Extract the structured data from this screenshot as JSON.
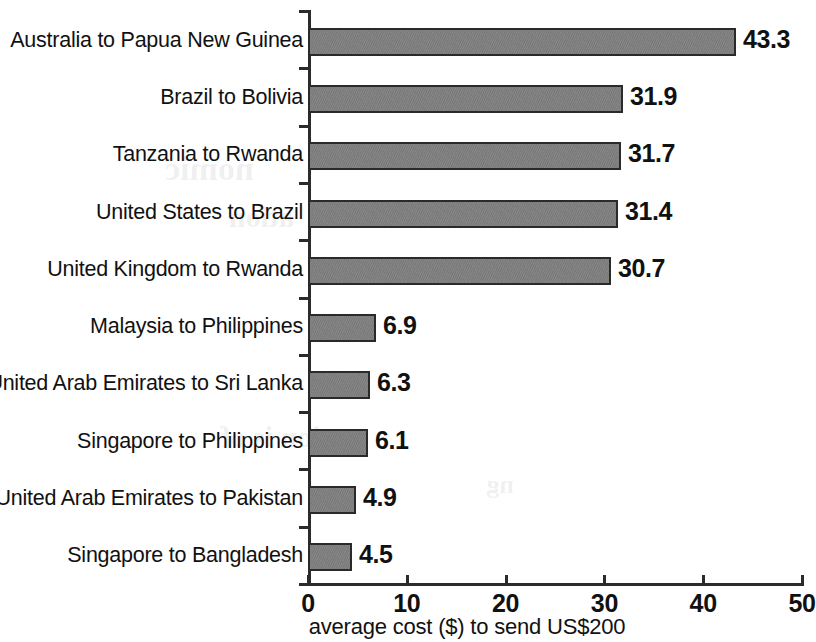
{
  "chart_data": {
    "type": "bar",
    "orientation": "horizontal",
    "title": "",
    "subtitle": "",
    "xlabel": "average cost ($) to send US$200",
    "ylabel": "",
    "xlim": [
      0,
      50
    ],
    "xticks": [
      "0",
      "10",
      "20",
      "30",
      "40",
      "50"
    ],
    "grid": false,
    "legend": null,
    "bar_color": "#7d7d7d",
    "bar_edge_color": "#2a2a2a",
    "categories": [
      "Australia to Papua New Guinea",
      "Brazil to Bolivia",
      "Tanzania to Rwanda",
      "United States to Brazil",
      "United Kingdom to Rwanda",
      "Malaysia to Philippines",
      "United Arab Emirates to Sri Lanka",
      "Singapore to Philippines",
      "United Arab Emirates to Pakistan",
      "Singapore to Bangladesh"
    ],
    "values": [
      43.3,
      31.9,
      31.7,
      31.4,
      30.7,
      6.9,
      6.3,
      6.1,
      4.9,
      4.5
    ],
    "value_labels": [
      "43.3",
      "31.9",
      "31.7",
      "31.4",
      "30.7",
      "6.9",
      "6.3",
      "6.1",
      "4.9",
      "4.5"
    ]
  },
  "background_artifacts": [
    {
      "text": "nomic",
      "x": 560,
      "y": 150,
      "size": 34
    },
    {
      "text": "ation",
      "x": 520,
      "y": 200,
      "size": 30
    },
    {
      "text": "ction is of",
      "x": 470,
      "y": 420,
      "size": 30
    },
    {
      "text": "ng",
      "x": 300,
      "y": 470,
      "size": 26
    }
  ]
}
